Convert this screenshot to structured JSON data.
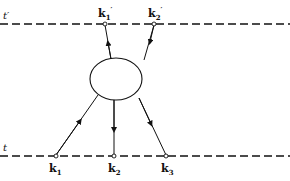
{
  "diagram": {
    "time_labels": {
      "upper": "t′",
      "lower": "t"
    },
    "outgoing": [
      {
        "label": "k",
        "sub": "1",
        "prime": "′"
      },
      {
        "label": "k",
        "sub": "2",
        "prime": "′"
      }
    ],
    "incoming": [
      {
        "label": "k",
        "sub": "1"
      },
      {
        "label": "k",
        "sub": "2"
      },
      {
        "label": "k",
        "sub": "3"
      }
    ],
    "colors": {
      "ink": "#111111",
      "background": "#ffffff"
    }
  }
}
